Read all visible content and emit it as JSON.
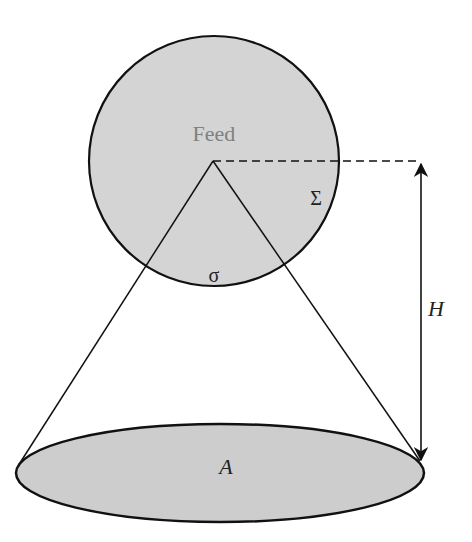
{
  "diagram": {
    "feed_label": "Feed",
    "sigma_upper_label": "Σ",
    "sigma_lower_label": "σ",
    "height_label": "H",
    "area_label": "A"
  },
  "colors": {
    "fill": "#d4d4d4",
    "stroke": "#111111",
    "feed_text": "#808080"
  }
}
